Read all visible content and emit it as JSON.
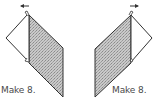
{
  "figures": [
    {
      "id": "left",
      "label": "Make 8.",
      "arrow_direction": "left"
    },
    {
      "id": "right",
      "label": "Make 8.",
      "arrow_direction": "right"
    }
  ],
  "colors": {
    "stroke": "#333333",
    "shade": "#bdbdbd",
    "text": "#4a4a4a"
  }
}
